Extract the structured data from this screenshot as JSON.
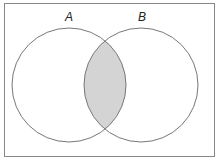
{
  "diagram": {
    "type": "venn",
    "sets": [
      {
        "label": "A",
        "cx": 69,
        "cy": 85,
        "r": 57
      },
      {
        "label": "B",
        "cx": 141,
        "cy": 85,
        "r": 57
      }
    ],
    "shaded_region": "A ∩ B",
    "colors": {
      "stroke": "#777777",
      "shade": "#d4d4d4",
      "frame": "#888888"
    }
  }
}
